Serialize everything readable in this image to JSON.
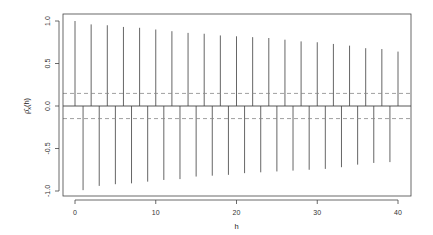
{
  "chart_data": {
    "type": "bar",
    "subtype": "acf-stem",
    "title": "",
    "xlabel": "h",
    "ylabel": "ρ̂x(h)",
    "xlim": [
      -1.5,
      41.5
    ],
    "ylim": [
      -1.05,
      1.08
    ],
    "x_ticks": [
      0,
      10,
      20,
      30,
      40
    ],
    "x_tick_labels": [
      "0",
      "10",
      "20",
      "30",
      "40"
    ],
    "y_ticks": [
      -1.0,
      -0.5,
      0.0,
      0.5,
      1.0
    ],
    "y_tick_labels": [
      "-1.0",
      "-0.5",
      "0.0",
      "0.5",
      "1.0"
    ],
    "grid": false,
    "zero_line": 0.0,
    "confidence_bounds": [
      0.148,
      -0.148
    ],
    "confidence_style": "dashed",
    "x": [
      0,
      1,
      2,
      3,
      4,
      5,
      6,
      7,
      8,
      9,
      10,
      11,
      12,
      13,
      14,
      15,
      16,
      17,
      18,
      19,
      20,
      21,
      22,
      23,
      24,
      25,
      26,
      27,
      28,
      29,
      30,
      31,
      32,
      33,
      34,
      35,
      36,
      37,
      38,
      39,
      40
    ],
    "values": [
      1.0,
      -0.99,
      0.96,
      -0.94,
      0.95,
      -0.92,
      0.93,
      -0.91,
      0.92,
      -0.89,
      0.9,
      -0.87,
      0.88,
      -0.86,
      0.86,
      -0.83,
      0.85,
      -0.82,
      0.83,
      -0.81,
      0.82,
      -0.79,
      0.81,
      -0.78,
      0.8,
      -0.77,
      0.78,
      -0.76,
      0.76,
      -0.75,
      0.75,
      -0.74,
      0.73,
      -0.72,
      0.71,
      -0.69,
      0.68,
      -0.67,
      0.67,
      -0.66,
      0.64
    ],
    "colors": {
      "stem": "#555555",
      "axis": "#444444",
      "bounds": "#888888",
      "text": "#333333"
    }
  }
}
